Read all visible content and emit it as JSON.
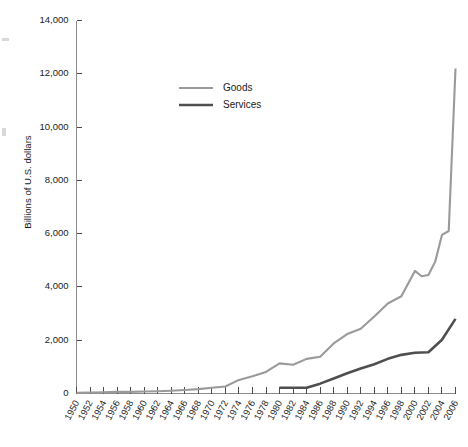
{
  "chart_data": {
    "type": "line",
    "title": "",
    "subtitle": "",
    "xlabel": "",
    "ylabel": "Billions of U.S. dollars",
    "ylim": [
      0,
      14000
    ],
    "xlim": [
      1950,
      2006
    ],
    "grid": false,
    "legend_position": "upper-center-left",
    "y_ticks": [
      0,
      2000,
      4000,
      6000,
      8000,
      10000,
      12000,
      14000
    ],
    "y_tick_labels": [
      "0",
      "2,000",
      "4,000",
      "6,000",
      "8,000",
      "10,000",
      "12,000",
      "14,000"
    ],
    "x_ticks": [
      1950,
      1952,
      1954,
      1956,
      1958,
      1960,
      1962,
      1964,
      1966,
      1968,
      1970,
      1972,
      1974,
      1976,
      1978,
      1980,
      1982,
      1984,
      1986,
      1988,
      1990,
      1992,
      1994,
      1996,
      1998,
      2000,
      2002,
      2004,
      2006
    ],
    "x_tick_labels": [
      "1950",
      "1952",
      "1954",
      "1956",
      "1958",
      "1960",
      "1962",
      "1964",
      "1966",
      "1968",
      "1970",
      "1972",
      "1974",
      "1976",
      "1978",
      "1980",
      "1982",
      "1984",
      "1986",
      "1988",
      "1990",
      "1992",
      "1994",
      "1996",
      "1998",
      "2000",
      "2002",
      "2004",
      "2006"
    ],
    "series": [
      {
        "name": "Goods",
        "color": "#9a9a9a",
        "stroke_width": 2.1,
        "x": [
          1950,
          1952,
          1954,
          1956,
          1958,
          1960,
          1962,
          1964,
          1966,
          1968,
          1970,
          1972,
          1974,
          1976,
          1978,
          1980,
          1982,
          1984,
          1986,
          1988,
          1990,
          1992,
          1994,
          1996,
          1998,
          2000,
          2001,
          2002,
          2003,
          2004,
          2005,
          2006
        ],
        "values": [
          30,
          40,
          45,
          60,
          60,
          75,
          85,
          105,
          130,
          165,
          215,
          265,
          510,
          650,
          810,
          1130,
          1080,
          1300,
          1380,
          1880,
          2230,
          2430,
          2890,
          3380,
          3650,
          4600,
          4400,
          4450,
          4950,
          5950,
          6100,
          12200
        ]
      },
      {
        "name": "Services",
        "color": "#4f4f4f",
        "stroke_width": 2.6,
        "x": [
          1980,
          1982,
          1984,
          1986,
          1988,
          1990,
          1992,
          1994,
          1996,
          1998,
          2000,
          2002,
          2004,
          2006
        ],
        "values": [
          215,
          215,
          215,
          370,
          560,
          760,
          940,
          1100,
          1300,
          1450,
          1530,
          1550,
          2020,
          2800
        ]
      }
    ]
  },
  "legend": {
    "items": [
      {
        "label": "Goods",
        "color": "#9a9a9a",
        "width": 2.1
      },
      {
        "label": "Services",
        "color": "#4f4f4f",
        "width": 2.6
      }
    ]
  }
}
